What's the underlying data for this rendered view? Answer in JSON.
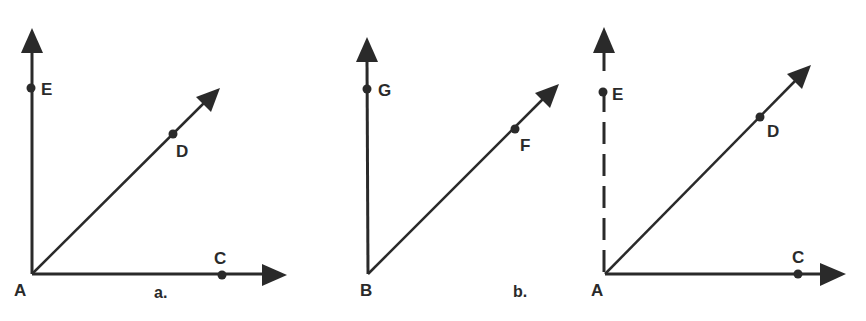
{
  "figures": [
    {
      "id": "a",
      "caption": "a.",
      "vertex": "A",
      "rays": [
        {
          "direction": "vertical",
          "point": "E",
          "style": "solid"
        },
        {
          "direction": "diagonal",
          "point": "D",
          "style": "solid"
        },
        {
          "direction": "horizontal",
          "point": "C",
          "style": "solid"
        }
      ],
      "labels": {
        "vertex": "A",
        "up": "E",
        "diag": "D",
        "right": "C"
      }
    },
    {
      "id": "b",
      "caption": "b.",
      "vertex": "B",
      "rays": [
        {
          "direction": "vertical",
          "point": "G",
          "style": "solid"
        },
        {
          "direction": "diagonal",
          "point": "F",
          "style": "solid"
        }
      ],
      "labels": {
        "vertex": "B",
        "up": "G",
        "diag": "F"
      }
    },
    {
      "id": "c",
      "caption": "",
      "vertex": "A",
      "rays": [
        {
          "direction": "vertical",
          "point": "E",
          "style": "dashed"
        },
        {
          "direction": "diagonal",
          "point": "D",
          "style": "solid"
        },
        {
          "direction": "horizontal",
          "point": "C",
          "style": "solid"
        }
      ],
      "labels": {
        "vertex": "A",
        "up": "E",
        "diag": "D",
        "right": "C"
      }
    }
  ],
  "colors": {
    "ink": "#2a2a2a",
    "background": "#ffffff"
  }
}
